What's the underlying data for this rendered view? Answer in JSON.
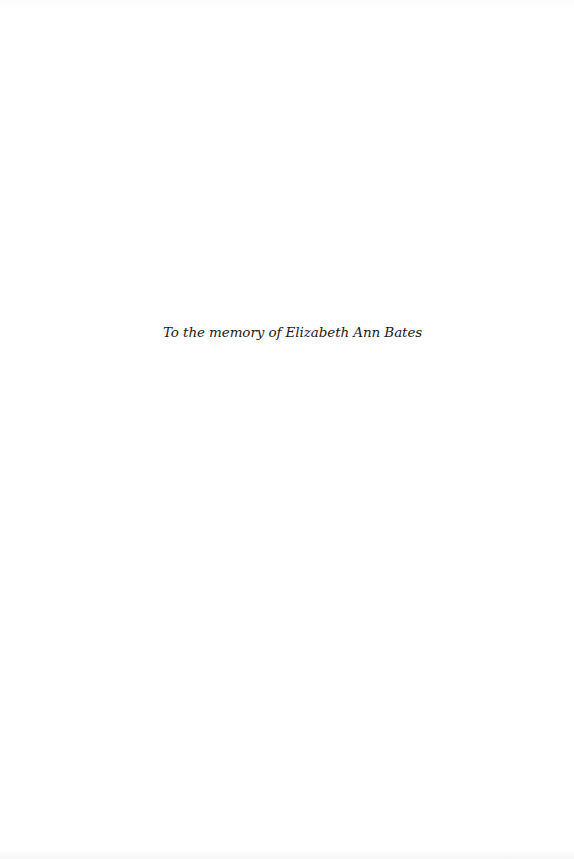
{
  "page": {
    "type": "dedication",
    "dedication_text": "To the memory of Elizabeth Ann Bates"
  }
}
